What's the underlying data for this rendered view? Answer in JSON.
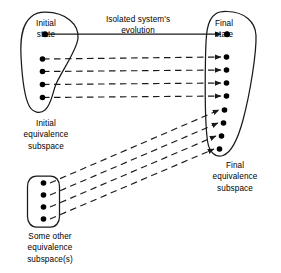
{
  "figure": {
    "stroke_color": "#1a1a1a",
    "dot_color": "#000000",
    "background": "#ffffff"
  },
  "labels": {
    "initial_state": "Initial\nstate",
    "final_state": "Final\nstate",
    "evolution": "Isolated system's\nevolution",
    "initial_subspace": "Initial\nequivalence\nsubspace",
    "final_subspace": "Final\nequivalence\nsubspace",
    "other_subspace": "Some other\nequivalence\nsubspace(s)"
  },
  "diagram_data": {
    "type": "diagram",
    "regions": [
      {
        "name": "initial-equivalence-subspace",
        "shape": "teardrop",
        "label": "Initial equivalence subspace",
        "dot_count": 5,
        "dots": [
          {
            "x": 45,
            "y": 34,
            "role": "initial-state"
          },
          {
            "x": 42,
            "y": 59,
            "role": "member"
          },
          {
            "x": 42,
            "y": 71,
            "role": "member"
          },
          {
            "x": 42,
            "y": 84,
            "role": "member"
          },
          {
            "x": 42,
            "y": 97,
            "role": "member"
          }
        ]
      },
      {
        "name": "final-equivalence-subspace",
        "shape": "teardrop-elongated",
        "label": "Final equivalence subspace",
        "dot_count": 9,
        "dots": [
          {
            "x": 226,
            "y": 34,
            "role": "final-state"
          },
          {
            "x": 226,
            "y": 57,
            "role": "member"
          },
          {
            "x": 226,
            "y": 70,
            "role": "member"
          },
          {
            "x": 226,
            "y": 83,
            "role": "member"
          },
          {
            "x": 226,
            "y": 96,
            "role": "member"
          },
          {
            "x": 224,
            "y": 110,
            "role": "member"
          },
          {
            "x": 223,
            "y": 123,
            "role": "member"
          },
          {
            "x": 221,
            "y": 136,
            "role": "member"
          },
          {
            "x": 219,
            "y": 149,
            "role": "member"
          }
        ]
      },
      {
        "name": "some-other-equivalence-subspace",
        "shape": "stadium",
        "label": "Some other equivalence subspace(s)",
        "dot_count": 4,
        "dots": [
          {
            "x": 43,
            "y": 183,
            "role": "member"
          },
          {
            "x": 43,
            "y": 195,
            "role": "member"
          },
          {
            "x": 43,
            "y": 207,
            "role": "member"
          },
          {
            "x": 43,
            "y": 219,
            "role": "member"
          }
        ]
      }
    ],
    "connections": [
      {
        "from": "initial-state",
        "to": "final-state",
        "style": "solid",
        "arrow": true
      },
      {
        "from": "initial-member-1",
        "to": "final-member-1",
        "style": "dashed",
        "arrow": true
      },
      {
        "from": "initial-member-2",
        "to": "final-member-2",
        "style": "dashed",
        "arrow": true
      },
      {
        "from": "initial-member-3",
        "to": "final-member-3",
        "style": "dashed",
        "arrow": true
      },
      {
        "from": "initial-member-4",
        "to": "final-member-4",
        "style": "dashed",
        "arrow": true
      },
      {
        "from": "other-member-1",
        "to": "final-member-5",
        "style": "dashed",
        "arrow": true
      },
      {
        "from": "other-member-2",
        "to": "final-member-6",
        "style": "dashed",
        "arrow": true
      },
      {
        "from": "other-member-3",
        "to": "final-member-7",
        "style": "dashed",
        "arrow": true
      },
      {
        "from": "other-member-4",
        "to": "final-member-8",
        "style": "dashed",
        "arrow": true
      }
    ]
  }
}
